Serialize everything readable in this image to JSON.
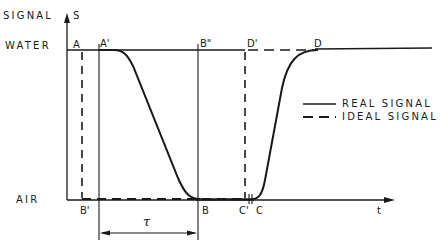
{
  "diagram": {
    "y_axis": {
      "label": "SIGNAL",
      "symbol": "S"
    },
    "x_axis": {
      "symbol": "t"
    },
    "levels": {
      "high": "WATER",
      "low": "AIR"
    },
    "points": {
      "A": "A",
      "A_prime": "A'",
      "B_double_prime": "B\"",
      "D_prime": "D'",
      "D": "D",
      "B_prime": "B'",
      "B": "B",
      "C_prime": "C'",
      "C": "C"
    },
    "interval": {
      "symbol": "τ",
      "from": "A'",
      "to": "B"
    },
    "legend": [
      {
        "style": "solid",
        "label": "REAL SIGNAL"
      },
      {
        "style": "dashed",
        "label": "IDEAL SIGNAL"
      }
    ],
    "colors": {
      "ink": "#1a1a1a",
      "background": "#ffffff"
    }
  }
}
